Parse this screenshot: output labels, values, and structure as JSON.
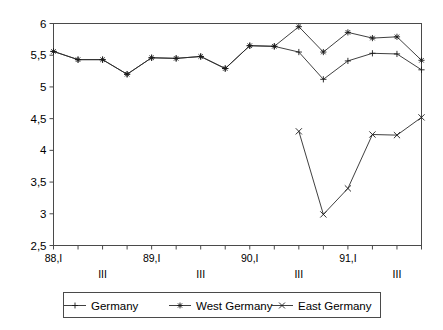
{
  "chart_data": {
    "type": "line",
    "title": "",
    "subtitle": "",
    "xlabel": "",
    "ylabel": "",
    "ylim": [
      2.5,
      6.0
    ],
    "ytick_step": 0.5,
    "grid": false,
    "decimal_separator": ",",
    "legend_position": "bottom",
    "ytick_labels": [
      "6",
      "5,5",
      "5",
      "4,5",
      "4",
      "3,5",
      "3",
      "2,5"
    ],
    "ytick_values": [
      6,
      5.5,
      5,
      4.5,
      4,
      3.5,
      3,
      2.5
    ],
    "x": [
      "88,I",
      "88,II",
      "88,III",
      "88,IV",
      "89,I",
      "89,II",
      "89,III",
      "89,IV",
      "90,I",
      "90,II",
      "90,III",
      "90,IV",
      "91,I",
      "91,II",
      "91,III",
      "91,IV"
    ],
    "xtick_labels_primary": [
      "88,I",
      "",
      "",
      "",
      "89,I",
      "",
      "",
      "",
      "90,I",
      "",
      "",
      "",
      "91,I",
      "",
      "",
      ""
    ],
    "xtick_labels_secondary": [
      "",
      "",
      "III",
      "",
      "",
      "",
      "III",
      "",
      "",
      "",
      "III",
      "",
      "",
      "",
      "III",
      ""
    ],
    "series": [
      {
        "name": "Germany",
        "marker": "plus",
        "values": [
          5.56,
          5.43,
          5.43,
          5.2,
          5.46,
          5.45,
          5.48,
          5.29,
          5.65,
          5.64,
          5.55,
          5.12,
          5.41,
          5.53,
          5.52,
          5.27
        ]
      },
      {
        "name": "West Germany",
        "marker": "asterisk",
        "values": [
          5.56,
          5.43,
          5.43,
          5.2,
          5.46,
          5.45,
          5.48,
          5.29,
          5.65,
          5.64,
          5.95,
          5.55,
          5.86,
          5.77,
          5.79,
          5.42
        ]
      },
      {
        "name": "East Germany",
        "marker": "cross",
        "values": [
          null,
          null,
          null,
          null,
          null,
          null,
          null,
          null,
          null,
          null,
          4.3,
          2.99,
          3.4,
          4.25,
          4.24,
          4.52
        ]
      }
    ],
    "legend": [
      {
        "label": "Germany",
        "marker": "plus"
      },
      {
        "label": "West Germany",
        "marker": "asterisk"
      },
      {
        "label": "East Germany",
        "marker": "cross"
      }
    ],
    "colors": {
      "line": "#2a2a2a",
      "axis": "#4a4a4a",
      "text": "#000000",
      "background": "#ffffff"
    }
  }
}
